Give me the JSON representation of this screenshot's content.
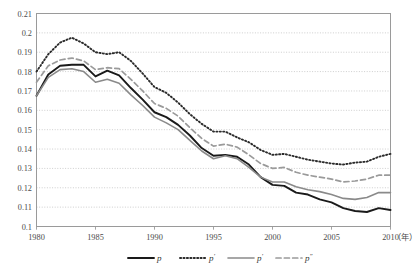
{
  "chart_data": {
    "type": "line",
    "title": "",
    "xlabel": "年",
    "ylabel": "",
    "xlim": [
      1980,
      2010
    ],
    "ylim": [
      0.1,
      0.21
    ],
    "ytick_step": 0.01,
    "xtick_step": 5,
    "grid": true,
    "grid_style": "dotted-horizontal",
    "legend_position": "bottom",
    "x": [
      1980,
      1981,
      1982,
      1983,
      1984,
      1985,
      1986,
      1987,
      1988,
      1989,
      1990,
      1991,
      1992,
      1993,
      1994,
      1995,
      1996,
      1997,
      1998,
      1999,
      2000,
      2001,
      2002,
      2003,
      2004,
      2005,
      2006,
      2007,
      2008,
      2009,
      2010
    ],
    "xticks": [
      "1980",
      "1985",
      "1990",
      "1995",
      "2000",
      "2005",
      "2010"
    ],
    "yticks": [
      "0.1",
      "0.11",
      "0.12",
      "0.13",
      "0.14",
      "0.15",
      "0.16",
      "0.17",
      "0.18",
      "0.19",
      "0.2",
      "0.21"
    ],
    "series": [
      {
        "name": "p",
        "style": "solid",
        "color": "#1a1a1a",
        "width": 1.9,
        "values": [
          0.1675,
          0.1785,
          0.183,
          0.1835,
          0.1835,
          0.1775,
          0.1805,
          0.178,
          0.1715,
          0.1655,
          0.159,
          0.1565,
          0.1525,
          0.147,
          0.1405,
          0.1365,
          0.137,
          0.136,
          0.132,
          0.1255,
          0.1215,
          0.121,
          0.1175,
          0.1165,
          0.114,
          0.1125,
          0.1095,
          0.108,
          0.1075,
          0.1095,
          0.1085
        ]
      },
      {
        "name": "p′",
        "style": "dotted",
        "color": "#2b2b2b",
        "width": 1.9,
        "values": [
          0.18,
          0.189,
          0.195,
          0.1975,
          0.1945,
          0.19,
          0.189,
          0.19,
          0.1855,
          0.179,
          0.172,
          0.169,
          0.164,
          0.158,
          0.153,
          0.149,
          0.149,
          0.146,
          0.1435,
          0.1395,
          0.137,
          0.1375,
          0.136,
          0.1345,
          0.1335,
          0.1325,
          0.132,
          0.133,
          0.1335,
          0.136,
          0.1375
        ]
      },
      {
        "name": "p′",
        "style": "solid",
        "color": "#8a8a8a",
        "width": 1.6,
        "values": [
          0.1675,
          0.177,
          0.181,
          0.1815,
          0.18,
          0.1745,
          0.176,
          0.174,
          0.168,
          0.1625,
          0.1565,
          0.1535,
          0.15,
          0.1445,
          0.139,
          0.135,
          0.1365,
          0.135,
          0.1305,
          0.1255,
          0.123,
          0.123,
          0.1205,
          0.119,
          0.118,
          0.1165,
          0.1145,
          0.114,
          0.115,
          0.1175,
          0.1175
        ]
      },
      {
        "name": "p″",
        "style": "dashed",
        "color": "#9a9a9a",
        "width": 1.7,
        "values": [
          0.1745,
          0.183,
          0.186,
          0.187,
          0.1855,
          0.181,
          0.182,
          0.1815,
          0.176,
          0.17,
          0.1635,
          0.161,
          0.157,
          0.151,
          0.1455,
          0.1415,
          0.1425,
          0.141,
          0.137,
          0.1325,
          0.13,
          0.1305,
          0.128,
          0.1265,
          0.1255,
          0.1245,
          0.123,
          0.1235,
          0.1245,
          0.1265,
          0.1265
        ]
      }
    ]
  },
  "legend": {
    "items": [
      {
        "label": "p",
        "prime": "",
        "style": "solid",
        "color": "#1a1a1a"
      },
      {
        "label": "p",
        "prime": "′",
        "style": "dotted",
        "color": "#2b2b2b"
      },
      {
        "label": "p",
        "prime": "′",
        "style": "solid",
        "color": "#8a8a8a"
      },
      {
        "label": "p",
        "prime": "″",
        "style": "dashed",
        "color": "#9a9a9a"
      }
    ]
  },
  "axis": {
    "x_unit_label": "（年）"
  }
}
